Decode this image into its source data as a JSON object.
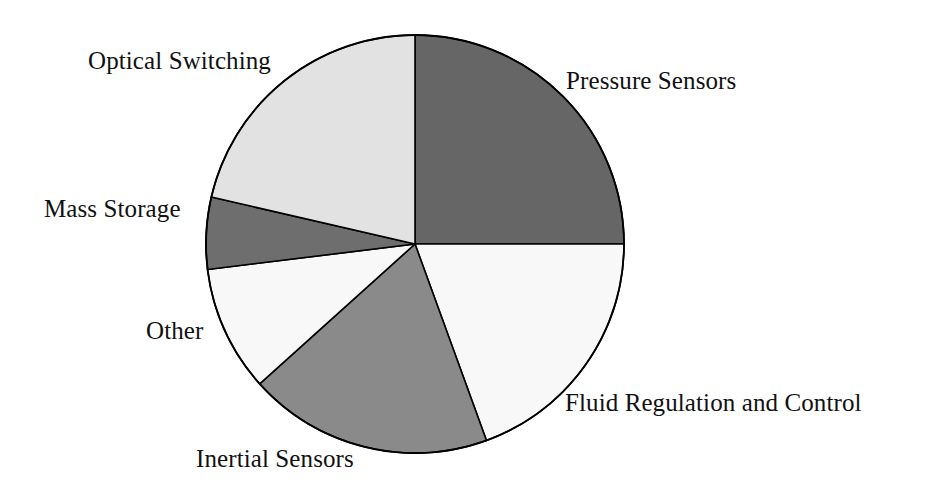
{
  "chart_data": {
    "type": "pie",
    "title": "",
    "subtitle": "",
    "xlabel": "",
    "ylabel": "",
    "legend_position": "none",
    "grid": false,
    "label_placement": "outside-callout",
    "start_angle_deg": 0,
    "direction": "clockwise",
    "units": "percent",
    "categories": [
      "Pressure Sensors",
      "Fluid Regulation and Control",
      "Inertial Sensors",
      "Other",
      "Mass Storage",
      "Optical Switching"
    ],
    "values": [
      25.0,
      19.4,
      18.9,
      9.7,
      5.6,
      21.4
    ],
    "slices": [
      {
        "label": "Pressure Sensors",
        "value": 25.0,
        "start_deg": 0,
        "end_deg": 90,
        "sweep_deg": 90,
        "fill": "#666666",
        "stroke": "#000000"
      },
      {
        "label": "Fluid Regulation and Control",
        "value": 19.4,
        "start_deg": 90,
        "end_deg": 160,
        "sweep_deg": 70,
        "fill": "#f8f8f8",
        "stroke": "#000000"
      },
      {
        "label": "Inertial Sensors",
        "value": 18.9,
        "start_deg": 160,
        "end_deg": 228,
        "sweep_deg": 68,
        "fill": "#8a8a8a",
        "stroke": "#000000"
      },
      {
        "label": "Other",
        "value": 9.7,
        "start_deg": 228,
        "end_deg": 263,
        "sweep_deg": 35,
        "fill": "#f8f8f8",
        "stroke": "#000000"
      },
      {
        "label": "Mass Storage",
        "value": 5.6,
        "start_deg": 263,
        "end_deg": 283,
        "sweep_deg": 20,
        "fill": "#6e6e6e",
        "stroke": "#000000"
      },
      {
        "label": "Optical Switching",
        "value": 21.4,
        "start_deg": 283,
        "end_deg": 360,
        "sweep_deg": 77,
        "fill": "#e2e2e2",
        "stroke": "#000000"
      }
    ],
    "geometry": {
      "center_x": 415,
      "center_y": 244,
      "radius": 209
    }
  },
  "labels": {
    "optical_switching": "Optical Switching",
    "pressure_sensors": "Pressure Sensors",
    "fluid_regulation": "Fluid Regulation and Control",
    "inertial_sensors": "Inertial Sensors",
    "mass_storage": "Mass Storage",
    "other": "Other"
  },
  "colors": {
    "background": "#ffffff",
    "outline": "#000000",
    "text": "#111111",
    "fill_dark": "#666666",
    "fill_medium": "#8a8a8a",
    "fill_light": "#e2e2e2",
    "fill_white": "#f8f8f8"
  }
}
